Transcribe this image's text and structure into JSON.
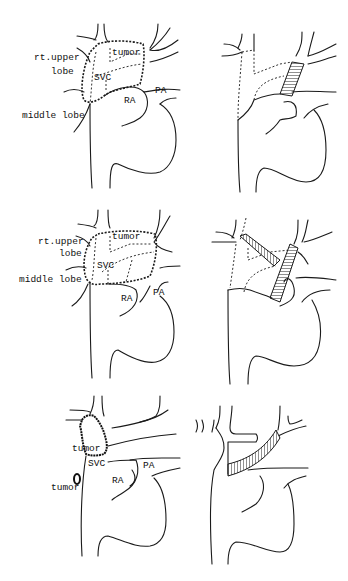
{
  "figure": {
    "rows": [
      {
        "id": "row1",
        "left_panel": {
          "labels": {
            "upper_lobe": "rt.upper",
            "upper_lobe_2": "lobe",
            "middle_lobe": "middle lobe",
            "tumor": "tumor",
            "svc": "SVC",
            "ra": "RA",
            "pa": "PA"
          }
        },
        "right_panel": {
          "description": "single straight graft reconstruction"
        }
      },
      {
        "id": "row2",
        "left_panel": {
          "labels": {
            "upper_lobe": "rt.upper",
            "upper_lobe_2": "lobe",
            "middle_lobe": "middle lobe",
            "tumor": "tumor",
            "svc": "SVC",
            "ra": "RA",
            "pa": "PA"
          }
        },
        "right_panel": {
          "description": "two crossing grafts reconstruction"
        }
      },
      {
        "id": "row3",
        "left_panel": {
          "labels": {
            "tumor_upper": "tumor",
            "tumor_lower": "tumor",
            "svc": "SVC",
            "ra": "RA",
            "pa": "PA"
          }
        },
        "right_panel": {
          "description": "oblique graft reconstruction"
        }
      }
    ]
  }
}
